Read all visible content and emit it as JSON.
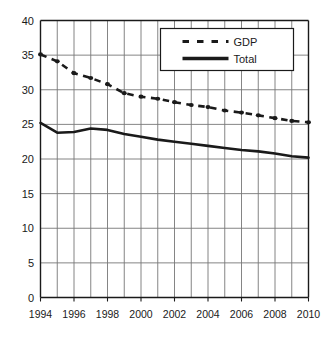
{
  "chart_data": {
    "type": "line",
    "title": "",
    "subtitle": "",
    "xlabel": "",
    "ylabel": "",
    "x": [
      1994,
      1995,
      1996,
      1997,
      1998,
      1999,
      2000,
      2001,
      2002,
      2003,
      2004,
      2005,
      2006,
      2007,
      2008,
      2009,
      2010
    ],
    "xlim": [
      1994,
      2010
    ],
    "ylim": [
      0,
      40
    ],
    "yticks": [
      0,
      5,
      10,
      15,
      20,
      25,
      30,
      35,
      40
    ],
    "xticks": [
      1994,
      1996,
      1998,
      2000,
      2002,
      2004,
      2006,
      2008,
      2010
    ],
    "xtick_labels": [
      "1994",
      "1996",
      "1998",
      "2000",
      "2002",
      "2004",
      "2006",
      "2008",
      "2010"
    ],
    "ytick_labels": [
      "0",
      "5",
      "10",
      "15",
      "20",
      "25",
      "30",
      "35",
      "40"
    ],
    "grid": true,
    "grid_x": true,
    "grid_y": true,
    "legend_position": "top-right",
    "series": [
      {
        "name": "GDP",
        "style": "dashed",
        "marker": true,
        "color": "#1a1a1a",
        "values": [
          35.1,
          34.1,
          32.4,
          31.7,
          30.8,
          29.5,
          29.0,
          28.7,
          28.2,
          27.8,
          27.5,
          27.0,
          26.7,
          26.3,
          25.9,
          25.5,
          25.3
        ]
      },
      {
        "name": "Total",
        "style": "solid",
        "marker": false,
        "color": "#1a1a1a",
        "values": [
          25.2,
          23.8,
          23.9,
          24.4,
          24.2,
          23.6,
          23.2,
          22.8,
          22.5,
          22.2,
          21.9,
          21.6,
          21.3,
          21.1,
          20.8,
          20.4,
          20.2
        ]
      }
    ]
  },
  "legend": {
    "entries": [
      {
        "label": "GDP"
      },
      {
        "label": "Total"
      }
    ]
  },
  "axes": {
    "frame_color": "#1a1a1a",
    "grid_color": "#777777"
  }
}
